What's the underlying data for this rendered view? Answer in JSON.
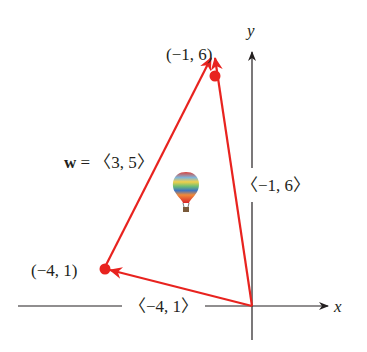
{
  "diagram": {
    "axes": {
      "x_label": "x",
      "y_label": "y",
      "color": "#231f20"
    },
    "vector_color": "#e8231f",
    "points": [
      {
        "label": "(−1, 6)",
        "coord": [
          -1,
          6
        ]
      },
      {
        "label": "(−4, 1)",
        "coord": [
          -4,
          1
        ]
      }
    ],
    "vectors": [
      {
        "label": "〈−1, 6〉",
        "from": [
          0,
          0
        ],
        "to": [
          -1,
          6
        ]
      },
      {
        "label": "〈−4, 1〉",
        "from": [
          0,
          0
        ],
        "to": [
          -4,
          1
        ]
      },
      {
        "label_bold": "w",
        "label_rest": " = 〈3, 5〉",
        "from": [
          -4,
          1
        ],
        "to": [
          -1,
          6
        ]
      }
    ],
    "icon": "hot-air-balloon-icon"
  }
}
